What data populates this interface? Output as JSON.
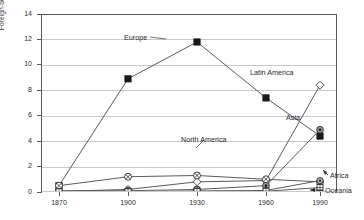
{
  "chart_data": {
    "type": "line",
    "title": "",
    "subtitle": "",
    "xlabel": "",
    "ylabel": "Foreign-born Residents (millions)",
    "x": [
      1870,
      1900,
      1930,
      1960,
      1990
    ],
    "xtick_labels": [
      "1870",
      "1900",
      "1930",
      "1960",
      "1990"
    ],
    "ytick_labels": [
      "0",
      "2",
      "4",
      "6",
      "8",
      "10",
      "12",
      "14"
    ],
    "ytick_values": [
      0,
      2,
      4,
      6,
      8,
      10,
      12,
      14
    ],
    "ylim": [
      0,
      14
    ],
    "grid": "horizontal",
    "legend_position": "inline-annotations",
    "series": [
      {
        "name": "Europe",
        "marker": "filled-square",
        "values": [
          0.5,
          8.9,
          11.8,
          7.4,
          4.4
        ]
      },
      {
        "name": "Latin America",
        "marker": "open-diamond",
        "values": [
          0.05,
          0.2,
          0.8,
          0.9,
          8.4
        ]
      },
      {
        "name": "Asia",
        "marker": "circled-dot",
        "values": [
          0.1,
          0.1,
          0.2,
          0.5,
          4.9
        ]
      },
      {
        "name": "North America",
        "marker": "circle-x",
        "values": [
          0.5,
          1.2,
          1.3,
          1.0,
          0.8
        ]
      },
      {
        "name": "Africa",
        "marker": "small-circled-dot",
        "values": [
          0.02,
          0.03,
          0.08,
          0.12,
          0.9
        ]
      },
      {
        "name": "Oceania",
        "marker": "small-square",
        "values": [
          0.02,
          0.02,
          0.05,
          0.06,
          0.35
        ]
      }
    ],
    "annotations": [
      {
        "text": "Europe",
        "series": "Europe"
      },
      {
        "text": "Latin America",
        "series": "Latin America"
      },
      {
        "text": "Asia",
        "series": "Asia"
      },
      {
        "text": "North America",
        "series": "North America"
      },
      {
        "text": "Africa",
        "series": "Africa"
      },
      {
        "text": "Oceania",
        "series": "Oceania"
      }
    ],
    "colors": {
      "line": "#5a5a5a",
      "marker_fill": "#1a1a1a",
      "marker_open": "#ffffff",
      "grid": "#c9c9c9",
      "axis": "#5a5a5a",
      "text": "#2b2b2b",
      "background": "#ffffff"
    }
  }
}
